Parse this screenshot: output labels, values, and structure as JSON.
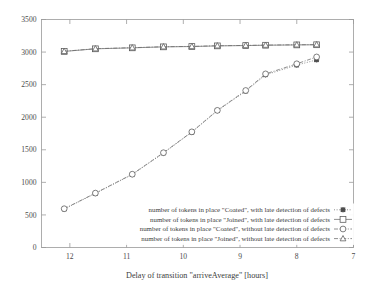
{
  "chart_data": {
    "type": "line",
    "title": "",
    "xlabel": "Delay of transition \"arriveAverage\" [hours]",
    "ylabel": "",
    "xlim": [
      12.5,
      7.0
    ],
    "ylim": [
      0,
      3500
    ],
    "x_reversed": true,
    "grid": false,
    "legend_position": "inside bottom-right",
    "xticks": [
      12,
      11,
      10,
      9,
      8,
      7
    ],
    "xtick_labels": [
      "12",
      "11",
      "10",
      "9",
      "8",
      "7"
    ],
    "yticks": [
      0,
      500,
      1000,
      1500,
      2000,
      2500,
      3000,
      3500
    ],
    "ytick_labels": [
      "0",
      "500",
      "1000",
      "1500",
      "2000",
      "2500",
      "3000",
      "3500"
    ],
    "x": [
      12.1,
      11.55,
      10.9,
      10.35,
      9.85,
      9.4,
      8.9,
      8.55,
      8.0,
      7.65
    ],
    "series": [
      {
        "name": "number of tokens in place \"Coated\", with late detection of defects",
        "marker": "star",
        "dash": "dotted",
        "values": [
          590,
          830,
          1120,
          1450,
          1770,
          2100,
          2400,
          2650,
          2800,
          2880
        ]
      },
      {
        "name": "number of tokens in place \"Joined\", with late detection of defects",
        "marker": "square",
        "dash": "solid",
        "values": [
          3010,
          3050,
          3065,
          3080,
          3085,
          3095,
          3100,
          3105,
          3110,
          3112
        ]
      },
      {
        "name": "number of tokens in place \"Coated\", without late detection of defects",
        "marker": "circle",
        "dash": "dashdot",
        "values": [
          595,
          835,
          1125,
          1455,
          1775,
          2105,
          2410,
          2665,
          2820,
          2925
        ]
      },
      {
        "name": "number of tokens in place \"Joined\", without late detection of defects",
        "marker": "triangle",
        "dash": "dashdot",
        "values": [
          3012,
          3052,
          3067,
          3082,
          3087,
          3097,
          3102,
          3107,
          3112,
          3114
        ]
      }
    ]
  },
  "legend": {
    "entries": [
      {
        "label": "number of tokens in place \"Coated\", with late detection of defects",
        "icon": "star-marker-icon"
      },
      {
        "label": "number of tokens in place \"Joined\", with late detection of defects",
        "icon": "square-marker-icon"
      },
      {
        "label": "number of tokens in place \"Coated\", without late detection of defects",
        "icon": "circle-marker-icon"
      },
      {
        "label": "number of tokens in place \"Joined\", without late detection of defects",
        "icon": "triangle-marker-icon"
      }
    ]
  },
  "colors": {
    "frame": "#9a9a9a",
    "line": "#6b6b6b",
    "text": "#3c3c3c",
    "background": "#ffffff",
    "marker_dark": "#595959"
  }
}
